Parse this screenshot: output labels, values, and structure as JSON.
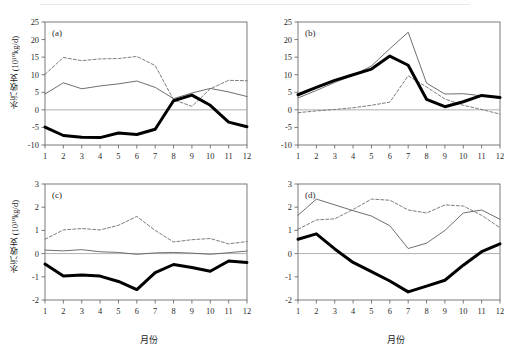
{
  "figure": {
    "background": "#ffffff",
    "axis_color": "#5a5a5a",
    "zero_line_color": "#9a9a9a",
    "series_colors": {
      "thick_solid": "#000000",
      "thin_solid": "#5f5f5f",
      "dashed": "#6e6e6e"
    },
    "labels": {
      "ylabel_text": "水汽收支 (10",
      "ylabel_exp": "10",
      "ylabel_tail": "kg/d)",
      "ylabel_full_ab": "水汽收支 (10¹⁰kg/d)",
      "ylabel_full_cd": "水汽收支 (10¹⁰kg/d)",
      "xlabel": "月份"
    }
  },
  "chart_data": [
    {
      "type": "line",
      "panel": "a",
      "tag": "(a)",
      "title": "",
      "xlabel": "月份",
      "ylabel": "水汽收支 (10¹⁰kg/d)",
      "x": [
        1,
        2,
        3,
        4,
        5,
        6,
        7,
        8,
        9,
        10,
        11,
        12
      ],
      "xlim": [
        1,
        12
      ],
      "ylim": [
        -10,
        25
      ],
      "yticks": [
        -10,
        -5,
        0,
        5,
        10,
        15,
        20,
        25
      ],
      "xticks": [
        1,
        2,
        3,
        4,
        5,
        6,
        7,
        8,
        9,
        10,
        11,
        12
      ],
      "grid": false,
      "legend": "none",
      "series": [
        {
          "name": "thick_solid",
          "style": "thick-solid",
          "values": [
            -4.9,
            -7.3,
            -7.8,
            -7.9,
            -6.6,
            -7.0,
            -5.5,
            2.6,
            4.2,
            1.3,
            -3.5,
            -4.8
          ]
        },
        {
          "name": "thin_solid",
          "style": "thin-solid",
          "values": [
            4.5,
            7.7,
            6.0,
            6.8,
            7.4,
            8.2,
            6.4,
            3.2,
            4.8,
            6.1,
            5.1,
            3.8
          ]
        },
        {
          "name": "dashed",
          "style": "dashed",
          "values": [
            10.1,
            14.9,
            14.0,
            14.5,
            14.6,
            15.2,
            12.6,
            2.9,
            1.0,
            6.0,
            8.4,
            8.3
          ]
        }
      ]
    },
    {
      "type": "line",
      "panel": "b",
      "tag": "(b)",
      "title": "",
      "xlabel": "月份",
      "ylabel": "水汽收支 (10¹⁰kg/d)",
      "x": [
        1,
        2,
        3,
        4,
        5,
        6,
        7,
        8,
        9,
        10,
        11,
        12
      ],
      "xlim": [
        1,
        12
      ],
      "ylim": [
        -10,
        25
      ],
      "yticks": [
        -10,
        -5,
        0,
        5,
        10,
        15,
        20,
        25
      ],
      "xticks": [
        1,
        2,
        3,
        4,
        5,
        6,
        7,
        8,
        9,
        10,
        11,
        12
      ],
      "grid": false,
      "legend": "none",
      "series": [
        {
          "name": "thick_solid",
          "style": "thick-solid",
          "values": [
            4.3,
            6.4,
            8.4,
            10.0,
            11.6,
            15.3,
            12.7,
            3.0,
            0.9,
            2.3,
            4.1,
            3.5
          ]
        },
        {
          "name": "thin_solid",
          "style": "thin-solid",
          "values": [
            3.4,
            5.5,
            7.8,
            9.8,
            12.5,
            17.4,
            22.1,
            7.6,
            4.5,
            4.6,
            4.0,
            3.3
          ]
        },
        {
          "name": "dashed",
          "style": "dashed",
          "values": [
            -0.8,
            -0.3,
            0.1,
            0.6,
            1.3,
            2.2,
            9.7,
            6.5,
            3.1,
            1.3,
            0.1,
            -1.2
          ]
        }
      ]
    },
    {
      "type": "line",
      "panel": "c",
      "tag": "(c)",
      "title": "",
      "xlabel": "月份",
      "ylabel": "水汽收支 (10¹⁰kg/d)",
      "x": [
        1,
        2,
        3,
        4,
        5,
        6,
        7,
        8,
        9,
        10,
        11,
        12
      ],
      "xlim": [
        1,
        12
      ],
      "ylim": [
        -2,
        3
      ],
      "yticks": [
        -2,
        -1,
        0,
        1,
        2,
        3
      ],
      "xticks": [
        1,
        2,
        3,
        4,
        5,
        6,
        7,
        8,
        9,
        10,
        11,
        12
      ],
      "grid": false,
      "legend": "none",
      "series": [
        {
          "name": "thick_solid",
          "style": "thick-solid",
          "values": [
            -0.45,
            -0.97,
            -0.92,
            -0.97,
            -1.2,
            -1.55,
            -0.82,
            -0.47,
            -0.6,
            -0.76,
            -0.32,
            -0.38
          ]
        },
        {
          "name": "thin_solid",
          "style": "thin-solid",
          "values": [
            0.15,
            0.12,
            0.17,
            0.08,
            0.05,
            -0.03,
            0.03,
            0.05,
            0.02,
            -0.03,
            0.04,
            0.11
          ]
        },
        {
          "name": "dashed",
          "style": "dashed",
          "values": [
            0.62,
            1.02,
            1.08,
            1.02,
            1.22,
            1.6,
            1.0,
            0.5,
            0.6,
            0.65,
            0.42,
            0.52
          ]
        }
      ]
    },
    {
      "type": "line",
      "panel": "d",
      "tag": "(d)",
      "title": "",
      "xlabel": "月份",
      "ylabel": "水汽收支 (10¹⁰kg/d)",
      "x": [
        1,
        2,
        3,
        4,
        5,
        6,
        7,
        8,
        9,
        10,
        11,
        12
      ],
      "xlim": [
        1,
        12
      ],
      "ylim": [
        -2,
        3
      ],
      "yticks": [
        -2,
        -1,
        0,
        1,
        2,
        3
      ],
      "xticks": [
        1,
        2,
        3,
        4,
        5,
        6,
        7,
        8,
        9,
        10,
        11,
        12
      ],
      "grid": false,
      "legend": "none",
      "series": [
        {
          "name": "thick_solid",
          "style": "thick-solid",
          "values": [
            0.62,
            0.85,
            0.2,
            -0.38,
            -0.78,
            -1.18,
            -1.65,
            -1.4,
            -1.15,
            -0.5,
            0.08,
            0.42
          ]
        },
        {
          "name": "thin_solid",
          "style": "thin-solid",
          "values": [
            1.65,
            2.35,
            2.1,
            1.85,
            1.62,
            1.2,
            0.22,
            0.45,
            1.0,
            1.75,
            1.88,
            1.48
          ]
        },
        {
          "name": "dashed",
          "style": "dashed",
          "values": [
            1.05,
            1.45,
            1.5,
            1.9,
            2.35,
            2.3,
            1.88,
            1.75,
            2.1,
            2.05,
            1.65,
            1.12
          ]
        }
      ]
    }
  ]
}
